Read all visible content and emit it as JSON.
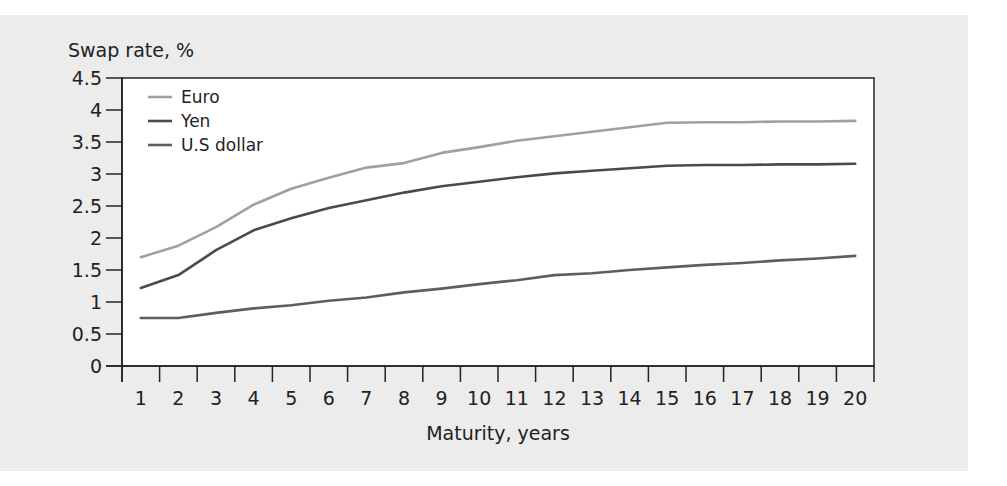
{
  "chart_data": {
    "type": "line",
    "title": "",
    "ylabel": "Swap rate, %",
    "xlabel": "Maturity, years",
    "ylim": [
      0,
      4.5
    ],
    "yticks": [
      0,
      0.5,
      1,
      1.5,
      2,
      2.5,
      3,
      3.5,
      4,
      4.5
    ],
    "ytick_labels": [
      "0",
      "0.5",
      "1",
      "1.5",
      "2",
      "2.5",
      "3",
      "3.5",
      "4",
      "4.5"
    ],
    "categories": [
      "1",
      "2",
      "3",
      "4",
      "5",
      "6",
      "7",
      "8",
      "9",
      "10",
      "11",
      "12",
      "13",
      "14",
      "15",
      "16",
      "17",
      "18",
      "19",
      "20"
    ],
    "grid": false,
    "legend_position": "upper-left-inside",
    "series": [
      {
        "name": "Euro",
        "color": "#a0a0a0",
        "values": [
          1.7,
          1.88,
          2.17,
          2.52,
          2.77,
          2.94,
          3.1,
          3.17,
          3.33,
          3.42,
          3.52,
          3.59,
          3.66,
          3.73,
          3.8,
          3.81,
          3.81,
          3.82,
          3.82,
          3.83
        ]
      },
      {
        "name": "Yen",
        "color": "#4a4a4a",
        "values": [
          1.22,
          1.42,
          1.81,
          2.12,
          2.31,
          2.47,
          2.59,
          2.71,
          2.81,
          2.88,
          2.95,
          3.01,
          3.05,
          3.09,
          3.13,
          3.14,
          3.14,
          3.15,
          3.15,
          3.16
        ]
      },
      {
        "name": "U.S dollar",
        "color": "#5e5e5e",
        "values": [
          0.75,
          0.75,
          0.83,
          0.9,
          0.95,
          1.02,
          1.07,
          1.15,
          1.21,
          1.28,
          1.34,
          1.42,
          1.45,
          1.5,
          1.54,
          1.58,
          1.61,
          1.65,
          1.68,
          1.72
        ]
      }
    ]
  },
  "colors": {
    "panel_background": "#ececec",
    "plot_background": "#ffffff",
    "axis": "#222222"
  }
}
